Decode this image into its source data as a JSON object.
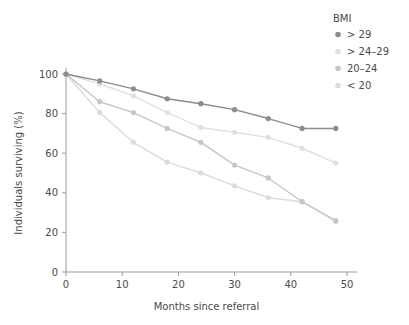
{
  "chart_data": {
    "type": "line",
    "title": "",
    "xlabel": "Months since referral",
    "ylabel": "Individuals surviving (%)",
    "xlim": [
      0,
      50
    ],
    "ylim": [
      0,
      100
    ],
    "xticks": [
      0,
      10,
      20,
      30,
      40,
      50
    ],
    "yticks": [
      0,
      20,
      40,
      60,
      80,
      100
    ],
    "xticklabels": [
      "0",
      "10",
      "20",
      "30",
      "40",
      "50"
    ],
    "yticklabels": [
      "0",
      "20",
      "40",
      "60",
      "80",
      "100"
    ],
    "grid": false,
    "legend_position": "top-right",
    "legend_title": "BMI",
    "x": [
      0,
      6,
      12,
      18,
      24,
      30,
      36,
      42,
      48
    ],
    "series": [
      {
        "name": "> 29",
        "color": "#8c8c8c",
        "values": [
          100,
          96.5,
          92.5,
          87.5,
          85,
          82,
          77.5,
          72.5,
          72.5
        ]
      },
      {
        "name": "> 24–29",
        "color": "#e0e0e0",
        "values": [
          100,
          95,
          89,
          80.5,
          73,
          70.5,
          68,
          62.5,
          55
        ]
      },
      {
        "name": "20–24",
        "color": "#c6c6c6",
        "values": [
          100,
          86,
          80.5,
          72.5,
          65.5,
          54,
          47.5,
          35.5,
          26
        ]
      },
      {
        "name": "< 20",
        "color": "#dcdcdc",
        "values": [
          100,
          80.5,
          65.5,
          55.5,
          50,
          43.5,
          37.5,
          35.5,
          25.5
        ]
      }
    ]
  },
  "legend": {
    "title": "BMI",
    "items": [
      {
        "label": "> 29",
        "color": "#8c8c8c"
      },
      {
        "label": "> 24–29",
        "color": "#e0e0e0"
      },
      {
        "label": "20–24",
        "color": "#c6c6c6"
      },
      {
        "label": "< 20",
        "color": "#dcdcdc"
      }
    ]
  },
  "axes": {
    "x_title": "Months since referral",
    "y_title": "Individuals surviving (%)"
  }
}
